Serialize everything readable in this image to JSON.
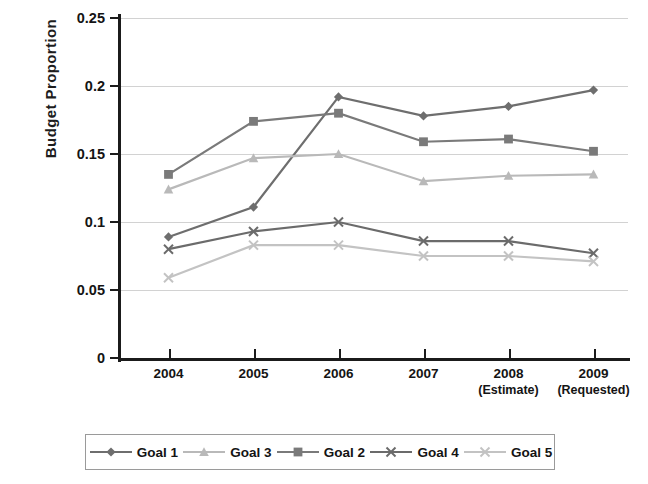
{
  "chart_data": {
    "type": "line",
    "title": "",
    "xlabel": "",
    "ylabel": "Budget Proportion",
    "categories": [
      "2004",
      "2005",
      "2006",
      "2007",
      "2008",
      "2009"
    ],
    "category_sublabels": [
      "",
      "",
      "",
      "",
      "(Estimate)",
      "(Requested)"
    ],
    "ylim": [
      0,
      0.25
    ],
    "ytick_labels": [
      "0",
      "0.05",
      "0.1",
      "0.15",
      "0.2",
      "0.25"
    ],
    "ytick_values": [
      0,
      0.05,
      0.1,
      0.15,
      0.2,
      0.25
    ],
    "grid": true,
    "legend_position": "bottom",
    "legend_order": [
      "Goal 1",
      "Goal 3",
      "Goal 2",
      "Goal 4",
      "Goal 5"
    ],
    "series": [
      {
        "name": "Goal 1",
        "marker": "diamond",
        "color": "#6e6e6e",
        "values": [
          0.089,
          0.111,
          0.192,
          0.178,
          0.185,
          0.197
        ]
      },
      {
        "name": "Goal 3",
        "marker": "triangle",
        "color": "#b9b9b9",
        "values": [
          0.124,
          0.147,
          0.15,
          0.13,
          0.134,
          0.135
        ]
      },
      {
        "name": "Goal 2",
        "marker": "square",
        "color": "#7a7a7a",
        "values": [
          0.135,
          0.174,
          0.18,
          0.159,
          0.161,
          0.152
        ]
      },
      {
        "name": "Goal 4",
        "marker": "cross",
        "color": "#6b6b6b",
        "values": [
          0.08,
          0.093,
          0.1,
          0.086,
          0.086,
          0.077
        ]
      },
      {
        "name": "Goal 5",
        "marker": "cross",
        "color": "#c3c3c3",
        "values": [
          0.059,
          0.083,
          0.083,
          0.075,
          0.075,
          0.071
        ]
      }
    ]
  },
  "axis": {
    "y_title": "Budget Proportion"
  }
}
